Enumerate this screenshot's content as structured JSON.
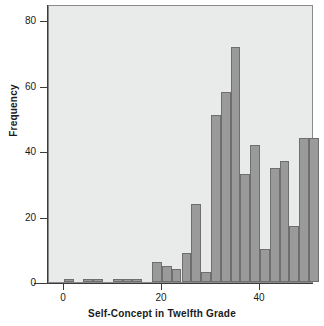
{
  "chart_data": {
    "type": "bar",
    "title": "",
    "subtitle": "",
    "xlabel": "Self-Concept in Twelfth Grade",
    "ylabel": "Frequency",
    "xlim": [
      -3,
      51
    ],
    "ylim": [
      0,
      85
    ],
    "xticks": [
      0,
      20,
      40
    ],
    "xtick_labels": [
      "0",
      "20",
      "40"
    ],
    "yticks": [
      0,
      20,
      40,
      60,
      80
    ],
    "ytick_labels": [
      "0",
      "20",
      "40",
      "60",
      "80"
    ],
    "grid": false,
    "legend": null,
    "bin_width": 2,
    "bar_color": "#9a9a9a",
    "bar_edge_color": "#6e6e6e",
    "plot_background": "#e9eaea",
    "axis_color": "#3b3b3b",
    "bins": [
      {
        "left": 0,
        "right": 2,
        "value": 1
      },
      {
        "left": 4,
        "right": 6,
        "value": 1
      },
      {
        "left": 6,
        "right": 8,
        "value": 1
      },
      {
        "left": 10,
        "right": 12,
        "value": 1
      },
      {
        "left": 12,
        "right": 14,
        "value": 1
      },
      {
        "left": 14,
        "right": 16,
        "value": 1
      },
      {
        "left": 18,
        "right": 20,
        "value": 6
      },
      {
        "left": 20,
        "right": 22,
        "value": 5
      },
      {
        "left": 22,
        "right": 24,
        "value": 4
      },
      {
        "left": 24,
        "right": 26,
        "value": 9
      },
      {
        "left": 26,
        "right": 28,
        "value": 24
      },
      {
        "left": 28,
        "right": 30,
        "value": 3
      },
      {
        "left": 30,
        "right": 32,
        "value": 51
      },
      {
        "left": 32,
        "right": 34,
        "value": 58
      },
      {
        "left": 34,
        "right": 36,
        "value": 72
      },
      {
        "left": 36,
        "right": 38,
        "value": 33
      },
      {
        "left": 38,
        "right": 40,
        "value": 42
      },
      {
        "left": 40,
        "right": 42,
        "value": 10
      },
      {
        "left": 42,
        "right": 44,
        "value": 35
      },
      {
        "left": 44,
        "right": 46,
        "value": 37
      },
      {
        "left": 46,
        "right": 48,
        "value": 17
      },
      {
        "left": 48,
        "right": 50,
        "value": 44
      },
      {
        "left": 50,
        "right": 52,
        "value": 44
      }
    ],
    "categories": [
      "0-2",
      "4-6",
      "6-8",
      "10-12",
      "12-14",
      "14-16",
      "18-20",
      "20-22",
      "22-24",
      "24-26",
      "26-28",
      "28-30",
      "30-32",
      "32-34",
      "34-36",
      "36-38",
      "38-40",
      "40-42",
      "42-44",
      "44-46",
      "46-48",
      "48-50",
      "50-52"
    ],
    "values": [
      1,
      1,
      1,
      1,
      1,
      1,
      6,
      5,
      4,
      9,
      24,
      3,
      51,
      58,
      72,
      33,
      42,
      10,
      35,
      37,
      17,
      44,
      44
    ]
  }
}
